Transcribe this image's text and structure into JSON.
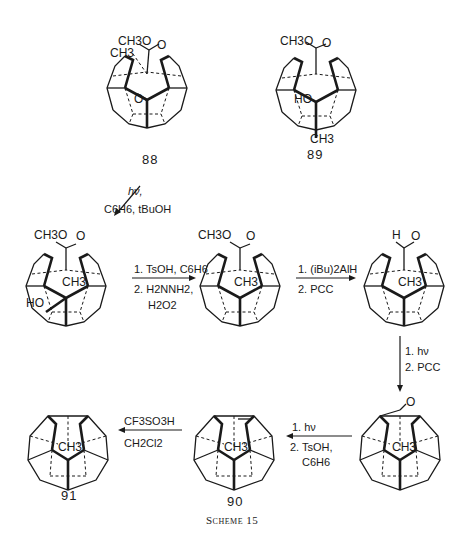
{
  "scheme": {
    "caption": "Scheme 15",
    "compounds": [
      {
        "id": "88",
        "label": "88",
        "substituents": [
          "CH3O",
          "CH3",
          "O",
          "O"
        ]
      },
      {
        "id": "89",
        "label": "89",
        "substituents": [
          "CH3O",
          "O",
          "HO",
          "CH3"
        ]
      },
      {
        "id": "int1",
        "label": "",
        "substituents": [
          "CH3O",
          "O",
          "CH3",
          "HO"
        ]
      },
      {
        "id": "int2",
        "label": "",
        "substituents": [
          "CH3O",
          "O",
          "CH3"
        ]
      },
      {
        "id": "int3",
        "label": "",
        "substituents": [
          "H",
          "O",
          "CH3"
        ]
      },
      {
        "id": "int4",
        "label": "",
        "substituents": [
          "O",
          "CH3"
        ]
      },
      {
        "id": "90",
        "label": "90",
        "substituents": [
          "CH3"
        ]
      },
      {
        "id": "91",
        "label": "91",
        "substituents": [
          "CH3"
        ]
      }
    ],
    "arrows": [
      {
        "from": "88",
        "to": "int1",
        "conditions": [
          "hν,",
          "C6H6, tBuOH"
        ]
      },
      {
        "from": "int1",
        "to": "int2",
        "conditions": [
          "1. TsOH, C6H6",
          "2. H2NNH2,",
          "H2O2"
        ]
      },
      {
        "from": "int2",
        "to": "int3",
        "conditions": [
          "1. (iBu)2AlH",
          "2. PCC"
        ]
      },
      {
        "from": "int3",
        "to": "int4",
        "conditions": [
          "1. hν",
          "2. PCC"
        ]
      },
      {
        "from": "int4",
        "to": "90",
        "conditions": [
          "1. hν",
          "2. TsOH,",
          "C6H6"
        ]
      },
      {
        "from": "90",
        "to": "91",
        "conditions": [
          "CF3SO3H",
          "CH2Cl2"
        ]
      }
    ]
  }
}
